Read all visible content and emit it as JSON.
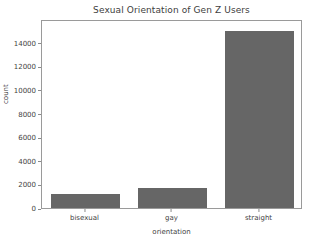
{
  "chart_data": {
    "type": "bar",
    "title": "Sexual Orientation of Gen Z Users",
    "xlabel": "orientation",
    "ylabel": "count",
    "categories": [
      "bisexual",
      "gay",
      "straight"
    ],
    "values": [
      1200,
      1700,
      15000
    ],
    "ylim": [
      0,
      16000
    ],
    "yticks": [
      0,
      2000,
      4000,
      6000,
      8000,
      10000,
      12000,
      14000
    ],
    "ytick_labels": [
      "0",
      "2000",
      "4000",
      "6000",
      "8000",
      "10000",
      "12000",
      "14000"
    ],
    "grid": false,
    "legend": null,
    "bar_color": "#666666",
    "frame_color": "#9a9a9a",
    "background": "#ffffff"
  }
}
